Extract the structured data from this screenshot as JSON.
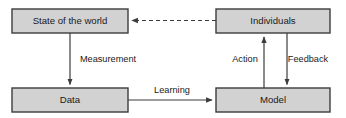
{
  "diagram": {
    "colors": {
      "node_fill": "#d2d2d2",
      "node_stroke": "#3c3c3c",
      "text": "#1a1a1a",
      "background": "#ffffff"
    },
    "nodes": [
      {
        "id": "state-of-the-world",
        "label": "State of the world",
        "x": 12,
        "y": 9,
        "width": 116,
        "height": 24
      },
      {
        "id": "individuals",
        "label": "Individuals",
        "x": 216,
        "y": 9,
        "width": 114,
        "height": 24
      },
      {
        "id": "data",
        "label": "Data",
        "x": 12,
        "y": 88,
        "width": 116,
        "height": 24
      },
      {
        "id": "model",
        "label": "Model",
        "x": 216,
        "y": 88,
        "width": 114,
        "height": 24
      }
    ],
    "edges": [
      {
        "id": "measurement",
        "label": "Measurement",
        "from": "state-of-the-world",
        "to": "data",
        "style": "solid",
        "direction": "down",
        "label_x": 108,
        "label_y": 60
      },
      {
        "id": "learning",
        "label": "Learning",
        "from": "data",
        "to": "model",
        "style": "solid",
        "direction": "right",
        "label_x": 172,
        "label_y": 91
      },
      {
        "id": "action",
        "label": "Action",
        "from": "model",
        "to": "individuals",
        "style": "solid",
        "direction": "up",
        "label_x": 245,
        "label_y": 60
      },
      {
        "id": "feedback",
        "label": "Feedback",
        "from": "individuals",
        "to": "model",
        "style": "solid",
        "direction": "down",
        "label_x": 308,
        "label_y": 60
      },
      {
        "id": "influence",
        "label": "",
        "from": "individuals",
        "to": "state-of-the-world",
        "style": "dashed",
        "direction": "left",
        "label_x": 172,
        "label_y": 14
      }
    ]
  }
}
